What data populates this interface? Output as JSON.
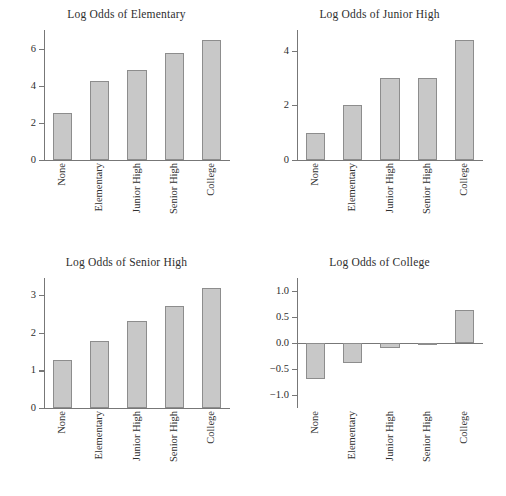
{
  "figure": {
    "background_color": "#ffffff",
    "bar_fill_color": "#c8c8c8",
    "bar_border_color": "#8d8d8d",
    "axis_color": "#777777",
    "text_color": "#2e2e2e",
    "layout": "2x2 grid of bar charts"
  },
  "chart_data": [
    {
      "type": "bar",
      "title": "Log Odds of Elementary",
      "xlabel": "",
      "ylabel": "",
      "categories": [
        "None",
        "Elementary",
        "Junior High",
        "Senior High",
        "College"
      ],
      "values": [
        2.52,
        4.26,
        4.85,
        5.78,
        6.45
      ],
      "yticks": [
        0,
        2,
        4,
        6
      ],
      "ytick_labels": [
        "0",
        "2",
        "4",
        "6"
      ],
      "ylim": [
        0,
        7.0
      ],
      "grid": false,
      "legend": "none",
      "xtick_rotation": 90
    },
    {
      "type": "bar",
      "title": "Log Odds of Junior High",
      "xlabel": "",
      "ylabel": "",
      "categories": [
        "None",
        "Elementary",
        "Junior High",
        "Senior High",
        "College"
      ],
      "values": [
        1.0,
        2.0,
        3.0,
        3.0,
        4.4
      ],
      "yticks": [
        0,
        2,
        4
      ],
      "ytick_labels": [
        "0",
        "2",
        "4"
      ],
      "ylim": [
        0,
        4.75
      ],
      "grid": false,
      "legend": "none",
      "xtick_rotation": 90
    },
    {
      "type": "bar",
      "title": "Log Odds of Senior High",
      "xlabel": "",
      "ylabel": "",
      "categories": [
        "None",
        "Elementary",
        "Junior High",
        "Senior High",
        "College"
      ],
      "values": [
        1.28,
        1.78,
        2.32,
        2.72,
        3.18
      ],
      "yticks": [
        0,
        1,
        2,
        3
      ],
      "ytick_labels": [
        "0",
        "1",
        "2",
        "3"
      ],
      "ylim": [
        0,
        3.45
      ],
      "grid": false,
      "legend": "none",
      "xtick_rotation": 90
    },
    {
      "type": "bar",
      "title": "Log Odds of College",
      "xlabel": "",
      "ylabel": "",
      "categories": [
        "None",
        "Elementary",
        "Junior High",
        "Senior High",
        "College"
      ],
      "values": [
        -0.7,
        -0.38,
        -0.09,
        -0.01,
        0.63
      ],
      "yticks": [
        -1.0,
        -0.5,
        0.0,
        0.5,
        1.0
      ],
      "ytick_labels": [
        "−1.0",
        "−0.5",
        "0.0",
        "0.5",
        "1.0"
      ],
      "ylim": [
        -1.25,
        1.25
      ],
      "grid": false,
      "legend": "none",
      "xtick_rotation": 90,
      "zero_baseline": true
    }
  ]
}
